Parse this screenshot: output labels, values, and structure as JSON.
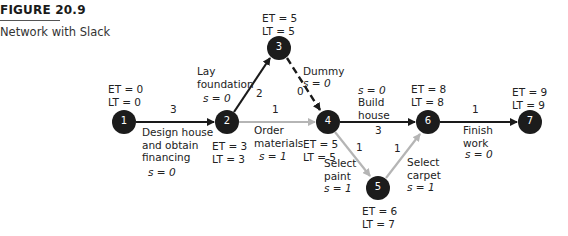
{
  "figure": {
    "number": "FIGURE 20.9",
    "caption": "Network with Slack"
  },
  "colors": {
    "critical": "#1a1a1a",
    "noncritical": "#b5b5b5",
    "node_fill": "#1c1c1c",
    "node_text": "#ffffff"
  },
  "nodes": [
    {
      "id": "1",
      "et": "ET = 0",
      "lt": "LT = 0"
    },
    {
      "id": "2",
      "et": "ET = 3",
      "lt": "LT = 3"
    },
    {
      "id": "3",
      "et": "ET = 5",
      "lt": "LT = 5"
    },
    {
      "id": "4",
      "et": "ET = 5",
      "lt": "LT = 5"
    },
    {
      "id": "5",
      "et": "ET = 6",
      "lt": "LT = 7"
    },
    {
      "id": "6",
      "et": "ET = 8",
      "lt": "LT = 8"
    },
    {
      "id": "7",
      "et": "ET = 9",
      "lt": "LT = 9"
    }
  ],
  "activities": [
    {
      "from": "1",
      "to": "2",
      "duration": "3",
      "name_l1": "Design house",
      "name_l2": "and obtain",
      "name_l3": "financing",
      "slack": "s = 0",
      "critical": true
    },
    {
      "from": "2",
      "to": "3",
      "duration": "2",
      "name_l1": "Lay",
      "name_l2": "foundation",
      "slack": "s = 0",
      "critical": true
    },
    {
      "from": "2",
      "to": "4",
      "duration": "1",
      "name_l1": "Order",
      "name_l2": "materials",
      "slack": "s = 1",
      "critical": false
    },
    {
      "from": "3",
      "to": "4",
      "duration": "0",
      "name_l1": "Dummy",
      "slack": "s = 0",
      "critical": true,
      "dashed": true
    },
    {
      "from": "4",
      "to": "6",
      "duration": "3",
      "name_l1": "Build",
      "name_l2": "house",
      "slack": "s = 0",
      "critical": true
    },
    {
      "from": "4",
      "to": "5",
      "duration": "1",
      "name_l1": "Select",
      "name_l2": "paint",
      "slack": "s = 1",
      "critical": false
    },
    {
      "from": "5",
      "to": "6",
      "duration": "1",
      "name_l1": "Select",
      "name_l2": "carpet",
      "slack": "s = 1",
      "critical": false
    },
    {
      "from": "6",
      "to": "7",
      "duration": "1",
      "name_l1": "Finish",
      "name_l2": "work",
      "slack": "s = 0",
      "critical": true
    }
  ]
}
